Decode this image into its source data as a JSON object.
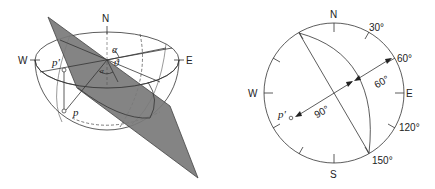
{
  "figure": {
    "left_panel": {
      "title": "hemisphere-with-plane",
      "compass": {
        "north": "N",
        "west": "W",
        "east": "E"
      },
      "points": {
        "p_prime": "p'",
        "p": "p"
      },
      "angles": {
        "alpha": "α",
        "theta": "ϑ",
        "small_alpha": "α"
      },
      "plane_color": "#7a7a7a"
    },
    "right_panel": {
      "title": "stereographic-projection",
      "compass": {
        "north": "N",
        "south": "S",
        "west": "W",
        "east": "E"
      },
      "rim_ticks": {
        "t30": "30°",
        "t60": "60°",
        "t120": "120°",
        "t150": "150°"
      },
      "inner_labels": {
        "arc_60": "60°",
        "arc_90": "90°"
      },
      "point": "p'"
    }
  }
}
